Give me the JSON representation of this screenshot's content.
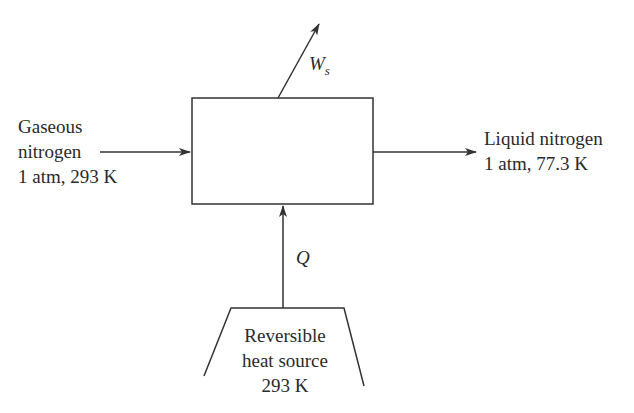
{
  "diagram": {
    "inlet": {
      "lines": [
        "Gaseous",
        "nitrogen",
        "1 atm, 293 K"
      ]
    },
    "outlet": {
      "lines": [
        "Liquid nitrogen",
        "1 atm, 77.3 K"
      ]
    },
    "work": {
      "symbol": "W",
      "subscript": "s"
    },
    "heat": {
      "symbol": "Q"
    },
    "source": {
      "lines": [
        "Reversible",
        "heat source",
        "293 K"
      ]
    },
    "colors": {
      "stroke": "#333333",
      "text": "#2a2a2a",
      "background": "#ffffff"
    }
  }
}
